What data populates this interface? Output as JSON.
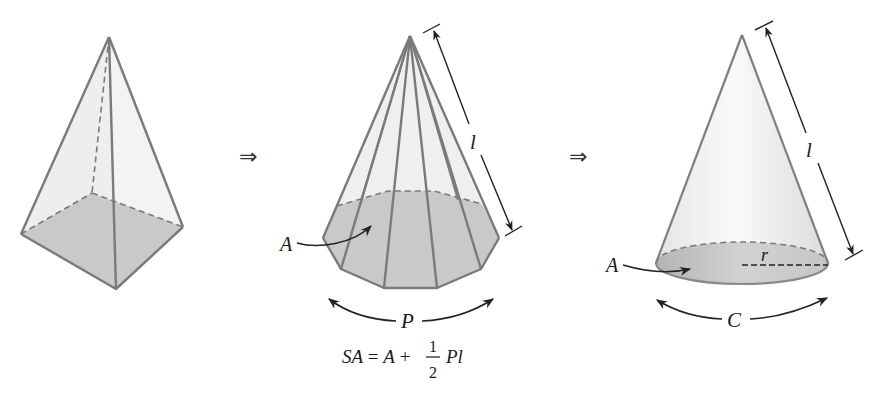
{
  "figure": {
    "panels": [
      {
        "id": "square-pyramid",
        "description": "Square pyramid with shaded base"
      },
      {
        "id": "decagonal-pyramid",
        "description": "Many-sided pyramid approaching a cone",
        "labels": {
          "base_area": "A",
          "perimeter": "P",
          "slant_height": "l"
        }
      },
      {
        "id": "cone",
        "description": "Right circular cone",
        "labels": {
          "base_area": "A",
          "circumference": "C",
          "slant_height": "l",
          "radius": "r"
        }
      }
    ],
    "transition_symbol": "⇒",
    "formula": {
      "lhs": "SA = A + ",
      "frac_num": "1",
      "frac_den": "2",
      "rhs": "Pl"
    }
  },
  "colors": {
    "edge": "#7a7a7a",
    "face": "#ececec",
    "base": "#c8c8c8",
    "dim_line": "#222222"
  }
}
